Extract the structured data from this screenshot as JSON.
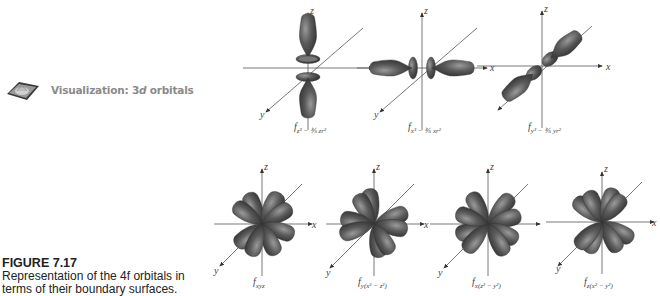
{
  "visualization_link": {
    "icon": "orbital-visualization-icon",
    "label_prefix": "Visualization: 3",
    "label_italic": "d",
    "label_suffix": " orbitals"
  },
  "figure": {
    "title": "FIGURE 7.17",
    "caption_line1": "Representation of the 4f orbitals in",
    "caption_line2": "terms of their boundary surfaces."
  },
  "axes_labels": {
    "x": "x",
    "y": "y",
    "z": "z"
  },
  "colors": {
    "lobe": "#4a4a4a",
    "lobe_highlight": "#8c8c8c",
    "axis": "#555555",
    "text_gray": "#8a8a8a"
  },
  "orbitals": [
    {
      "id": "z3",
      "label_main": "f",
      "label_sub": "z³ − ⅗ zr²"
    },
    {
      "id": "x3",
      "label_main": "f",
      "label_sub": "x³ − ⅗ xr²"
    },
    {
      "id": "y3",
      "label_main": "f",
      "label_sub": "y³ − ⅗ yr²"
    },
    {
      "id": "xyz",
      "label_main": "f",
      "label_sub": "xyz"
    },
    {
      "id": "y_x2_z2",
      "label_main": "f",
      "label_sub": "y(x² − z²)"
    },
    {
      "id": "x_z2_y2",
      "label_main": "f",
      "label_sub": "x(z² − y²)"
    },
    {
      "id": "z_x2_y2",
      "label_main": "f",
      "label_sub": "z(x² − y²)"
    }
  ]
}
